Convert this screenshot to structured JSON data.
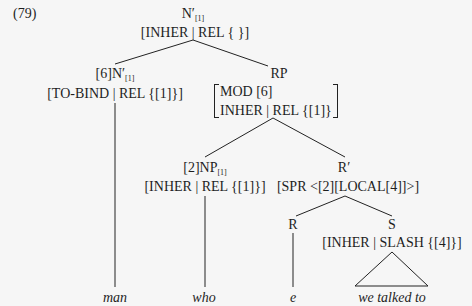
{
  "example_number": "(79)",
  "nodes": {
    "root": {
      "category": "N′",
      "index": "[1]",
      "features": "[INHER | REL { }]"
    },
    "head_noun": {
      "tag": "[6]",
      "category": "N′",
      "index": "[1]",
      "features": "[TO-BIND | REL {[1]}]"
    },
    "rp": {
      "category": "RP",
      "avm": [
        "MOD [6]",
        "INHER | REL {[1]}"
      ]
    },
    "np": {
      "tag": "[2]",
      "category": "NP",
      "index": "[1]",
      "features": "[INHER | REL {[1]}]"
    },
    "r_bar": {
      "category": "R′",
      "features": "[SPR <[2][LOCAL[4]]>]"
    },
    "r": {
      "category": "R"
    },
    "s": {
      "category": "S",
      "features": "[INHER | SLASH {[4]}]"
    }
  },
  "leaves": {
    "man": "man",
    "who": "who",
    "e": "e",
    "we_talked_to": "we talked to"
  }
}
